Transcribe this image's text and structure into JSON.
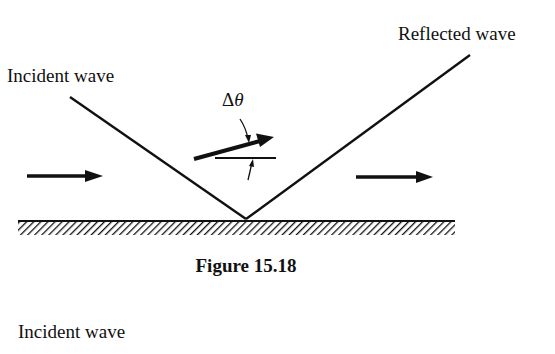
{
  "figure": {
    "caption": "Figure 15.18",
    "labels": {
      "incident_wave": "Incident wave",
      "reflected_wave": "Reflected wave",
      "angle_symbol_delta": "Δ",
      "angle_symbol_theta": "θ"
    },
    "elements": {
      "incident_ray": {
        "from": [
          70,
          97
        ],
        "to": [
          246,
          219
        ]
      },
      "reflected_ray": {
        "from": [
          246,
          219
        ],
        "to": [
          470,
          55
        ]
      },
      "surface": {
        "x_start": 18,
        "x_end": 455,
        "y": 220,
        "thickness": 15,
        "style": "hatched"
      },
      "left_arrow": {
        "from": [
          27,
          176
        ],
        "to": [
          103,
          176
        ]
      },
      "right_arrow": {
        "from": [
          356,
          177
        ],
        "to": [
          433,
          177
        ]
      },
      "tilted_arrow": {
        "from": [
          194,
          159
        ],
        "to": [
          274,
          137
        ]
      },
      "reference_line": {
        "from": [
          215,
          158
        ],
        "to": [
          276,
          158
        ]
      }
    }
  },
  "below_text": "Incident wave",
  "colors": {
    "ink": "#111111",
    "background": "#ffffff"
  }
}
